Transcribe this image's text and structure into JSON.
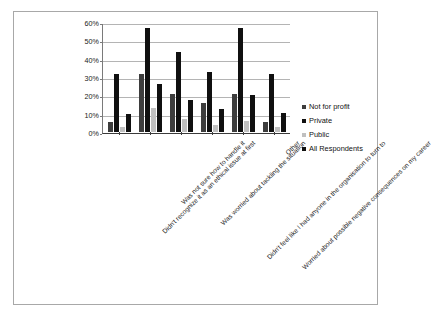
{
  "chart_data": {
    "type": "bar",
    "title": "",
    "subtitle": "",
    "xlabel": "",
    "ylabel": "",
    "ylim": [
      0,
      60
    ],
    "ytick_labels": [
      "0%",
      "10%",
      "20%",
      "30%",
      "40%",
      "50%",
      "60%"
    ],
    "ytick_values": [
      0,
      10,
      20,
      30,
      40,
      50,
      60
    ],
    "grid": true,
    "legend_position": "right",
    "categories": [
      "Didn't recognize it as an ethical issue at first",
      "Was not sure how to handle it",
      "Was worried about tackling the situation",
      "Didn't feel like I had anyone in the organisation to turn to",
      "Worried about possible negative consequences on my career",
      "Other"
    ],
    "series": [
      {
        "name": "Not for profit",
        "color": "#3d3d3d",
        "values": [
          5.5,
          31.5,
          21.0,
          16.0,
          21.0,
          5.5
        ]
      },
      {
        "name": "Private",
        "color": "#101010",
        "values": [
          31.5,
          56.5,
          43.5,
          32.5,
          56.5,
          31.5
        ]
      },
      {
        "name": "Public",
        "color": "#c0c0c0",
        "values": [
          2.5,
          13.0,
          7.0,
          4.0,
          6.0,
          3.0
        ]
      },
      {
        "name": "All Respondents",
        "color": "#101010",
        "values": [
          10.0,
          26.0,
          17.5,
          12.5,
          20.0,
          10.5
        ]
      }
    ]
  },
  "legend": {
    "items": [
      {
        "label": "Not for profit"
      },
      {
        "label": "Private"
      },
      {
        "label": "Public"
      },
      {
        "label": "All Respondents"
      }
    ]
  }
}
